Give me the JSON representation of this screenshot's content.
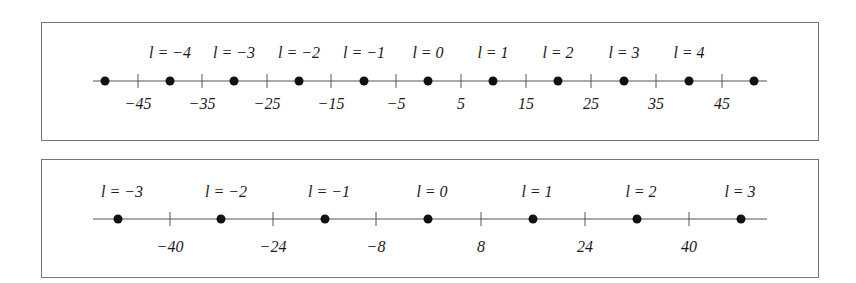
{
  "panels": [
    {
      "name": "top-panel",
      "box": {
        "x": 41,
        "y": 22,
        "w": 777,
        "h": 118
      },
      "axis": {
        "y": 81,
        "x1": 93,
        "x2": 767
      },
      "dots_x": [
        105,
        170,
        234,
        299,
        364,
        428,
        493,
        558,
        624,
        689,
        754
      ],
      "labels": [
        {
          "text": "l = −4",
          "x": 170
        },
        {
          "text": "l = −3",
          "x": 234
        },
        {
          "text": "l = −2",
          "x": 299
        },
        {
          "text": "l = −1",
          "x": 364
        },
        {
          "text": "l = 0",
          "x": 428
        },
        {
          "text": "l = 1",
          "x": 493
        },
        {
          "text": "l = 2",
          "x": 558
        },
        {
          "text": "l = 3",
          "x": 624
        },
        {
          "text": "l = 4",
          "x": 689
        }
      ],
      "label_y": 58,
      "ticks": [
        {
          "text": "−45",
          "x": 138
        },
        {
          "text": "−35",
          "x": 202
        },
        {
          "text": "−25",
          "x": 267
        },
        {
          "text": "−15",
          "x": 331
        },
        {
          "text": "−5",
          "x": 396
        },
        {
          "text": "5",
          "x": 461
        },
        {
          "text": "15",
          "x": 526
        },
        {
          "text": "25",
          "x": 591
        },
        {
          "text": "35",
          "x": 656
        },
        {
          "text": "45",
          "x": 722
        }
      ],
      "tick_label_y": 109
    },
    {
      "name": "bottom-panel",
      "box": {
        "x": 41,
        "y": 159,
        "w": 777,
        "h": 118
      },
      "axis": {
        "y": 219,
        "x1": 93,
        "x2": 767
      },
      "dots_x": [
        118,
        221,
        325,
        428,
        533,
        637,
        741
      ],
      "labels": [
        {
          "text": "l = −3",
          "x": 122
        },
        {
          "text": "l = −2",
          "x": 226
        },
        {
          "text": "l = −1",
          "x": 329
        },
        {
          "text": "l = 0",
          "x": 432
        },
        {
          "text": "l = 1",
          "x": 537
        },
        {
          "text": "l = 2",
          "x": 641
        },
        {
          "text": "l = 3",
          "x": 740
        }
      ],
      "label_y": 197,
      "ticks": [
        {
          "text": "−40",
          "x": 170
        },
        {
          "text": "−24",
          "x": 273
        },
        {
          "text": "−8",
          "x": 376
        },
        {
          "text": "8",
          "x": 481
        },
        {
          "text": "24",
          "x": 585
        },
        {
          "text": "40",
          "x": 689
        }
      ],
      "tick_label_y": 252
    }
  ],
  "colors": {
    "line": "#555555",
    "dot": "#111111",
    "border": "#777777"
  }
}
